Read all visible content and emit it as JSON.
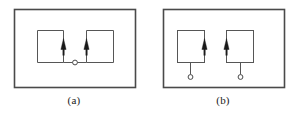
{
  "figure": {
    "background_color": "#ffffff",
    "line_color": "#3a3a3a",
    "frame_color": "#4a4a4a",
    "arrow_color": "#1a1a1a",
    "node_color": "#4a4a4a",
    "width": 297,
    "height": 118
  },
  "panels": [
    {
      "id": "a",
      "caption": "(a)",
      "frame": {
        "x": 14,
        "y": 9,
        "width": 122,
        "height": 79
      },
      "description": "Two rectangular loops joined at a shared bottom conductor with a single central node; both arrows point upward on the inner vertical branches.",
      "loops": [
        {
          "name": "left-loop",
          "rect": {
            "x": 37,
            "y": 30,
            "width": 26,
            "height": 32
          },
          "arrow": {
            "x": 63,
            "y_from": 55,
            "y_to": 40,
            "direction": "up"
          }
        },
        {
          "name": "right-loop",
          "rect": {
            "x": 86,
            "y": 30,
            "width": 27,
            "height": 32
          },
          "arrow": {
            "x": 86,
            "y_from": 55,
            "y_to": 40,
            "direction": "up"
          }
        }
      ],
      "connector": {
        "x_from": 63,
        "x_to": 86,
        "y": 62
      },
      "nodes": [
        {
          "name": "center-node",
          "cx": 75,
          "cy": 62,
          "r": 2.4
        }
      ]
    },
    {
      "id": "b",
      "caption": "(b)",
      "frame": {
        "x": 14,
        "y": 9,
        "width": 122,
        "height": 79
      },
      "description": "Two separate rectangular loops, each with its own downward lead ending in an open terminal node; arrows point upward on the facing inner branches.",
      "loops": [
        {
          "name": "left-loop",
          "rect": {
            "x": 28,
            "y": 30,
            "width": 27,
            "height": 32
          },
          "arrow": {
            "x": 55,
            "y_from": 55,
            "y_to": 40,
            "direction": "up"
          },
          "lead": {
            "x": 41,
            "y_from": 62,
            "y_to": 75
          },
          "node": {
            "name": "left-terminal-node",
            "cx": 41,
            "cy": 77,
            "r": 2.4
          }
        },
        {
          "name": "right-loop",
          "rect": {
            "x": 77,
            "y": 30,
            "width": 27,
            "height": 32
          },
          "arrow": {
            "x": 77,
            "y_from": 55,
            "y_to": 40,
            "direction": "up"
          },
          "lead": {
            "x": 91,
            "y_from": 62,
            "y_to": 75
          },
          "node": {
            "name": "right-terminal-node",
            "cx": 91,
            "cy": 77,
            "r": 2.4
          }
        }
      ]
    }
  ]
}
